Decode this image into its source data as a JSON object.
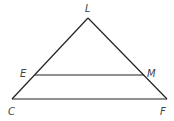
{
  "diagram": {
    "type": "triangle-with-midsegment",
    "stroke_color": "#222222",
    "label_color": "#444444",
    "vertices": {
      "L": {
        "x": 88,
        "y": 18
      },
      "C": {
        "x": 12,
        "y": 99
      },
      "F": {
        "x": 167,
        "y": 99
      },
      "E": {
        "x": 35,
        "y": 75
      },
      "M": {
        "x": 144,
        "y": 75
      }
    },
    "segments": [
      "LC",
      "LF",
      "CF",
      "EM"
    ],
    "labels": {
      "L": "L",
      "E": "E",
      "M": "M",
      "C": "C",
      "F": "F"
    }
  }
}
